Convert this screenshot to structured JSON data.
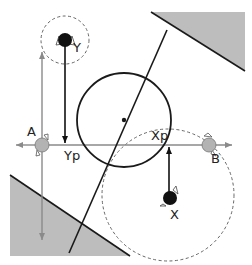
{
  "labels": {
    "point_a": "A",
    "point_b": "B",
    "point_x": "X",
    "point_y": "Y",
    "projection_x": "Xp",
    "projection_y": "Yp"
  },
  "colors": {
    "wall_fill": "#bdbdbd",
    "axis": "#8a8a8a",
    "line": "#1a1a1a",
    "node_gray": "#b3b3b3",
    "node_black": "#111111"
  }
}
